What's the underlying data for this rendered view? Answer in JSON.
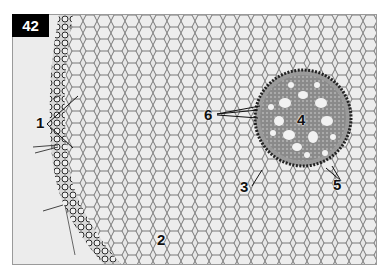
{
  "figure": {
    "number": "42",
    "labels": [
      {
        "id": "1",
        "x": 36,
        "y": 114
      },
      {
        "id": "2",
        "x": 157,
        "y": 231
      },
      {
        "id": "3",
        "x": 240,
        "y": 178
      },
      {
        "id": "4",
        "x": 297,
        "y": 111
      },
      {
        "id": "5",
        "x": 333,
        "y": 176
      },
      {
        "id": "6",
        "x": 204,
        "y": 106
      }
    ],
    "colors": {
      "background": "#ececec",
      "cell_wall": "#5a5a5a",
      "badge": "#000000"
    }
  }
}
